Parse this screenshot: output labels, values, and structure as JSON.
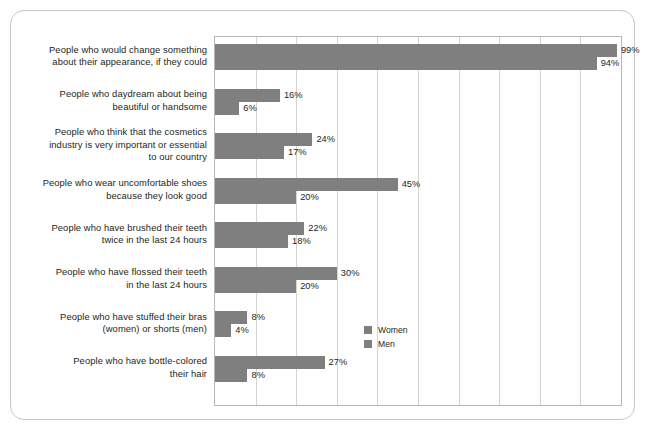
{
  "chart_data": {
    "type": "bar",
    "orientation": "horizontal",
    "title": "",
    "subtitle": "",
    "xlabel": "",
    "ylabel": "",
    "xlim": [
      0,
      100
    ],
    "xunit": "%",
    "grid": true,
    "gridline_interval": 10,
    "legend_position": "bottom-right",
    "bar_color": "#7f7f7f",
    "categories": [
      "People who would change something about their appearance, if they could",
      "People who daydream about being beautiful or handsome",
      "People who think that the cosmetics industry is very important or essential to our country",
      "People who wear uncomfortable shoes because they look good",
      "People who have brushed their teeth twice in the last 24 hours",
      "People who have flossed their teeth in the last 24 hours",
      "People who have stuffed their bras (women) or shorts (men)",
      "People who have bottle-colored their hair"
    ],
    "category_lines": [
      [
        "People who would change something",
        "about their appearance, if they could"
      ],
      [
        "People who daydream about being",
        "beautiful or handsome"
      ],
      [
        "People who think that the cosmetics",
        "industry is very important or essential",
        "to our country"
      ],
      [
        "People who wear uncomfortable shoes",
        "because they look good"
      ],
      [
        "People who have brushed their teeth",
        "twice in the last 24 hours"
      ],
      [
        "People who have flossed their teeth",
        "in the last 24 hours"
      ],
      [
        "People who have stuffed their bras",
        "(women) or shorts (men)"
      ],
      [
        "People who have bottle-colored",
        "their hair"
      ]
    ],
    "series": [
      {
        "name": "Women",
        "values": [
          99,
          16,
          24,
          45,
          22,
          30,
          8,
          27
        ],
        "labels": [
          "99%",
          "16%",
          "24%",
          "45%",
          "22%",
          "30%",
          "8%",
          "27%"
        ],
        "color": "#7f7f7f"
      },
      {
        "name": "Men",
        "values": [
          94,
          6,
          17,
          20,
          18,
          20,
          4,
          8
        ],
        "labels": [
          "94%",
          "6%",
          "17%",
          "20%",
          "18%",
          "20%",
          "4%",
          "8%"
        ],
        "color": "#7f7f7f"
      }
    ]
  },
  "legend": {
    "items": [
      {
        "label": "Women",
        "color": "#7f7f7f"
      },
      {
        "label": "Men",
        "color": "#7f7f7f"
      }
    ]
  }
}
